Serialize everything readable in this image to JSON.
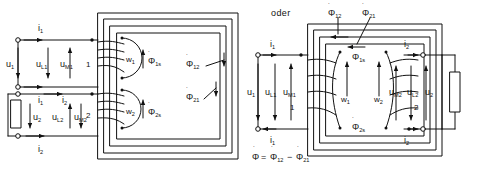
{
  "figure": {
    "caption_word": "oder",
    "equation": "Φ̇ = Φ̇12 − Φ̇21"
  },
  "left_diagram": {
    "name": "transformer-flux-diagram-both-coils-same-limb",
    "primary": {
      "current_top": "i1",
      "current_bottom": "i1",
      "voltage_source": "u1",
      "voltage_leakage": "uL1",
      "voltage_main": "uM1",
      "terminal_number": "1",
      "winding": "w1",
      "leakage_flux": "Φ̇1s"
    },
    "secondary": {
      "current_top": "i2",
      "current_bottom": "i2",
      "voltage_source": "u2",
      "voltage_leakage": "uL2",
      "voltage_main": "uM2",
      "terminal_number": "2",
      "winding": "w2",
      "leakage_flux": "Φ̇2s"
    },
    "mutual_flux_12": "Φ̇12",
    "mutual_flux_21": "Φ̇21"
  },
  "right_diagram": {
    "name": "transformer-flux-diagram-coils-opposite-limbs",
    "primary": {
      "current_top": "i1",
      "current_bottom": "i1",
      "voltage_source": "u1",
      "voltage_leakage": "uL1",
      "voltage_main": "uM1",
      "terminal_number": "1",
      "winding": "w1",
      "leakage_flux": "Φ̇1s"
    },
    "secondary": {
      "current_top": "i2",
      "current_bottom": "i2",
      "voltage_source": "u2",
      "voltage_leakage": "uL2",
      "voltage_main": "uM2",
      "terminal_number": "2",
      "winding": "w2",
      "leakage_flux": "Φ̇2s"
    },
    "mutual_flux_12": "Φ̇12",
    "mutual_flux_21": "Φ̇21"
  },
  "symbols": {
    "phi": "Φ",
    "dot_accent": "˙",
    "polarity_dot": "•",
    "minus": "−",
    "equals": "="
  }
}
